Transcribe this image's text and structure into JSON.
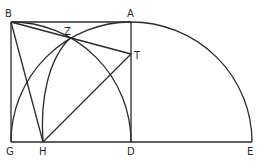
{
  "diagram": {
    "type": "geometric-construction",
    "stroke_color": "#2a2a2a",
    "background": "#ffffff",
    "points": {
      "B": {
        "label": "B",
        "x": 11,
        "y": 22
      },
      "A": {
        "label": "A",
        "x": 131,
        "y": 22
      },
      "G": {
        "label": "G",
        "x": 11,
        "y": 142
      },
      "D": {
        "label": "D",
        "x": 131,
        "y": 142
      },
      "E": {
        "label": "E",
        "x": 252,
        "y": 142
      },
      "H": {
        "label": "H",
        "x": 43,
        "y": 142
      },
      "Z": {
        "label": "Z",
        "x": 70,
        "y": 38
      },
      "T": {
        "label": "T",
        "x": 131,
        "y": 54
      }
    },
    "segments": [
      "BA",
      "BG",
      "AD",
      "GE",
      "BT",
      "BH",
      "HT"
    ],
    "arcs": [
      {
        "name": "arc-center-D-G-to-E",
        "center": "D",
        "radius": 120
      },
      {
        "name": "arc-center-G-D-to-B",
        "center": "G",
        "radius": 120
      },
      {
        "name": "curve-H-to-Z"
      }
    ]
  }
}
